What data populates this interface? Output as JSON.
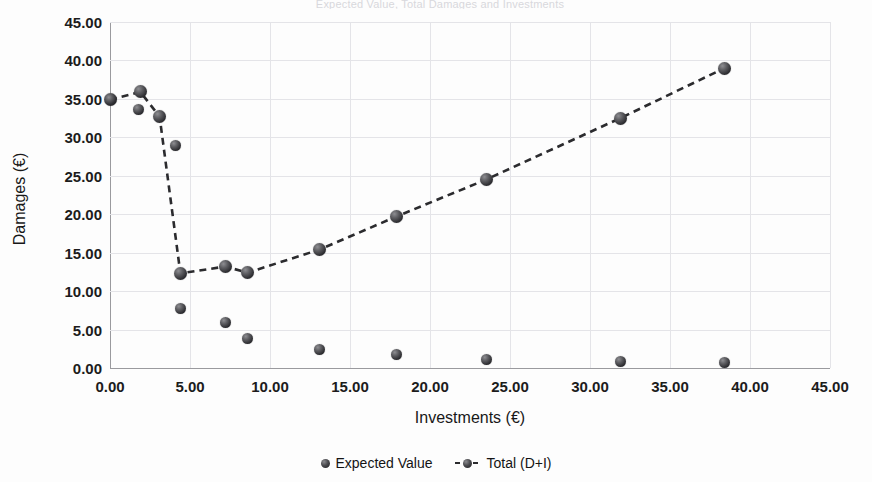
{
  "figure": {
    "title_faint": "Expected Value, Total Damages and Investments",
    "background": "#fdfdfd",
    "marker_color": "#2f2f33",
    "line_color": "#2b2b2e",
    "grid_color": "#e4e4e8"
  },
  "chart_data": {
    "type": "scatter",
    "title": "",
    "xlabel": "Investments (€)",
    "ylabel": "Damages (€)",
    "xlim": [
      0,
      45
    ],
    "ylim": [
      0,
      45
    ],
    "xticks": [
      "0.00",
      "5.00",
      "10.00",
      "15.00",
      "20.00",
      "25.00",
      "30.00",
      "35.00",
      "40.00",
      "45.00"
    ],
    "yticks": [
      "0.00",
      "5.00",
      "10.00",
      "15.00",
      "20.00",
      "25.00",
      "30.00",
      "35.00",
      "40.00",
      "45.00"
    ],
    "xtick_values": [
      0,
      5,
      10,
      15,
      20,
      25,
      30,
      35,
      40,
      45
    ],
    "ytick_values": [
      0,
      5,
      10,
      15,
      20,
      25,
      30,
      35,
      40,
      45
    ],
    "grid": true,
    "legend_position": "bottom",
    "series": [
      {
        "name": "Expected Value",
        "marker": "sphere",
        "line": "none",
        "points": [
          {
            "x": 0.0,
            "y": 34.9
          },
          {
            "x": 1.8,
            "y": 33.6
          },
          {
            "x": 4.1,
            "y": 29.0
          },
          {
            "x": 4.4,
            "y": 7.7
          },
          {
            "x": 7.2,
            "y": 5.9
          },
          {
            "x": 8.6,
            "y": 3.8
          },
          {
            "x": 13.1,
            "y": 2.4
          },
          {
            "x": 17.9,
            "y": 1.8
          },
          {
            "x": 23.5,
            "y": 1.1
          },
          {
            "x": 31.9,
            "y": 0.8
          },
          {
            "x": 38.4,
            "y": 0.7
          }
        ]
      },
      {
        "name": "Total (D+I)",
        "marker": "sphere",
        "line": "dashed",
        "points": [
          {
            "x": 0.0,
            "y": 34.9
          },
          {
            "x": 1.9,
            "y": 35.9
          },
          {
            "x": 3.1,
            "y": 32.7
          },
          {
            "x": 4.4,
            "y": 12.3
          },
          {
            "x": 7.2,
            "y": 13.2
          },
          {
            "x": 8.6,
            "y": 12.4
          },
          {
            "x": 13.1,
            "y": 15.4
          },
          {
            "x": 17.9,
            "y": 19.7
          },
          {
            "x": 23.5,
            "y": 24.5
          },
          {
            "x": 31.9,
            "y": 32.5
          },
          {
            "x": 38.4,
            "y": 39.0
          }
        ]
      }
    ]
  },
  "legend": {
    "items": [
      {
        "label": "Expected Value",
        "style": "marker"
      },
      {
        "label": "Total (D+I)",
        "style": "line-marker"
      }
    ]
  }
}
